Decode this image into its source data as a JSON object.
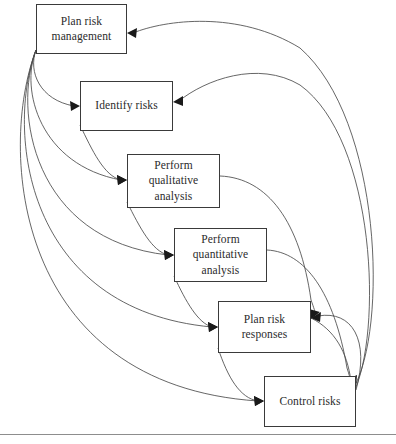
{
  "diagram": {
    "type": "process-flow",
    "canvas": {
      "width": 396,
      "height": 444
    },
    "style": {
      "box_border_color": "#3a3a3a",
      "box_fill_color": "#ffffff",
      "edge_color": "#4a4a4a",
      "arrow_color": "#1a1a1a",
      "text_color": "#2b2b2b",
      "rule_color": "#8d8d8d"
    },
    "nodes": [
      {
        "id": "plan-risk-management",
        "label": "Plan risk\nmanagement",
        "x": 36,
        "y": 4,
        "w": 91,
        "h": 50
      },
      {
        "id": "identify-risks",
        "label": "Identify risks",
        "x": 80,
        "y": 81,
        "w": 93,
        "h": 50
      },
      {
        "id": "perform-qualitative-analysis",
        "label": "Perform\nqualitative\nanalysis",
        "x": 127,
        "y": 154,
        "w": 93,
        "h": 54
      },
      {
        "id": "perform-quantitative-analysis",
        "label": "Perform\nquantitative\nanalysis",
        "x": 174,
        "y": 228,
        "w": 93,
        "h": 54
      },
      {
        "id": "plan-risk-responses",
        "label": "Plan risk\nresponses",
        "x": 218,
        "y": 301,
        "w": 93,
        "h": 52
      },
      {
        "id": "control-risks",
        "label": "Control risks",
        "x": 264,
        "y": 376,
        "w": 92,
        "h": 51
      }
    ],
    "edges": [
      {
        "id": "edge-plan-to-identify",
        "from": "plan-risk-management",
        "to": "identify-risks",
        "direction": "forward"
      },
      {
        "id": "edge-plan-to-qualitative",
        "from": "plan-risk-management",
        "to": "perform-qualitative-analysis",
        "direction": "forward"
      },
      {
        "id": "edge-plan-to-quantitative",
        "from": "plan-risk-management",
        "to": "perform-quantitative-analysis",
        "direction": "forward"
      },
      {
        "id": "edge-plan-to-responses",
        "from": "plan-risk-management",
        "to": "plan-risk-responses",
        "direction": "forward"
      },
      {
        "id": "edge-plan-to-control",
        "from": "plan-risk-management",
        "to": "control-risks",
        "direction": "forward"
      },
      {
        "id": "edge-identify-to-qualitative",
        "from": "identify-risks",
        "to": "perform-qualitative-analysis",
        "direction": "forward"
      },
      {
        "id": "edge-qualitative-to-quantitative",
        "from": "perform-qualitative-analysis",
        "to": "perform-quantitative-analysis",
        "direction": "forward"
      },
      {
        "id": "edge-quantitative-to-responses",
        "from": "perform-quantitative-analysis",
        "to": "plan-risk-responses",
        "direction": "forward"
      },
      {
        "id": "edge-responses-to-control",
        "from": "plan-risk-responses",
        "to": "control-risks",
        "direction": "forward"
      },
      {
        "id": "edge-control-to-plan",
        "from": "control-risks",
        "to": "plan-risk-management",
        "direction": "feedback"
      },
      {
        "id": "edge-control-to-identify",
        "from": "control-risks",
        "to": "identify-risks",
        "direction": "feedback"
      },
      {
        "id": "edge-control-to-responses",
        "from": "control-risks",
        "to": "plan-risk-responses",
        "direction": "feedback"
      },
      {
        "id": "edge-responses-to-control-right",
        "from": "plan-risk-responses",
        "to": "control-risks",
        "direction": "feedback"
      },
      {
        "id": "edge-qualitative-return",
        "from": "perform-qualitative-analysis",
        "to": "plan-risk-responses",
        "direction": "feedback"
      },
      {
        "id": "edge-quantitative-return",
        "from": "perform-quantitative-analysis",
        "to": "control-risks",
        "direction": "feedback"
      }
    ],
    "footer_rule": {
      "y": 434
    }
  }
}
